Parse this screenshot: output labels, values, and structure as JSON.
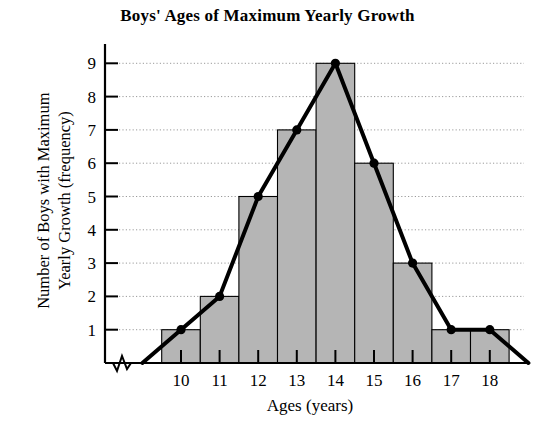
{
  "chart_data": {
    "type": "bar",
    "title": "Boys' Ages of Maximum Yearly Growth",
    "xlabel": "Ages (years)",
    "ylabel": "Number of Boys with Maximum Yearly Growth (frequency)",
    "categories": [
      "10",
      "11",
      "12",
      "13",
      "14",
      "15",
      "16",
      "17",
      "18"
    ],
    "values": [
      1,
      2,
      5,
      7,
      9,
      6,
      3,
      1,
      1
    ],
    "series": [
      {
        "name": "Frequency histogram",
        "values": [
          1,
          2,
          5,
          7,
          9,
          6,
          3,
          1,
          1
        ]
      },
      {
        "name": "Frequency polygon",
        "x": [
          9,
          10,
          11,
          12,
          13,
          14,
          15,
          16,
          17,
          18,
          19
        ],
        "values": [
          0,
          1,
          2,
          5,
          7,
          9,
          6,
          3,
          1,
          1,
          0
        ]
      }
    ],
    "xlim": [
      9,
      19
    ],
    "ylim": [
      0,
      9.6
    ],
    "x_ticks": [
      "10",
      "11",
      "12",
      "13",
      "14",
      "15",
      "16",
      "17",
      "18"
    ],
    "y_ticks": [
      "1",
      "2",
      "3",
      "4",
      "5",
      "6",
      "7",
      "8",
      "9"
    ],
    "grid": "horizontal-dotted",
    "legend": "none",
    "x_axis_break": true,
    "colors": {
      "bar_fill": "#b5b5b5",
      "bar_stroke": "#000000",
      "polygon_line": "#000000",
      "axis": "#000000",
      "gridline": "#9a9a9a",
      "background": "#ffffff"
    },
    "annotations": []
  },
  "figure": {
    "title": "Boys' Ages of Maximum Yearly Growth",
    "x_axis_title": "Ages (years)",
    "y_axis_title_line1": "Number of Boys with Maximum",
    "y_axis_title_line2": "Yearly Growth (frequency)"
  }
}
